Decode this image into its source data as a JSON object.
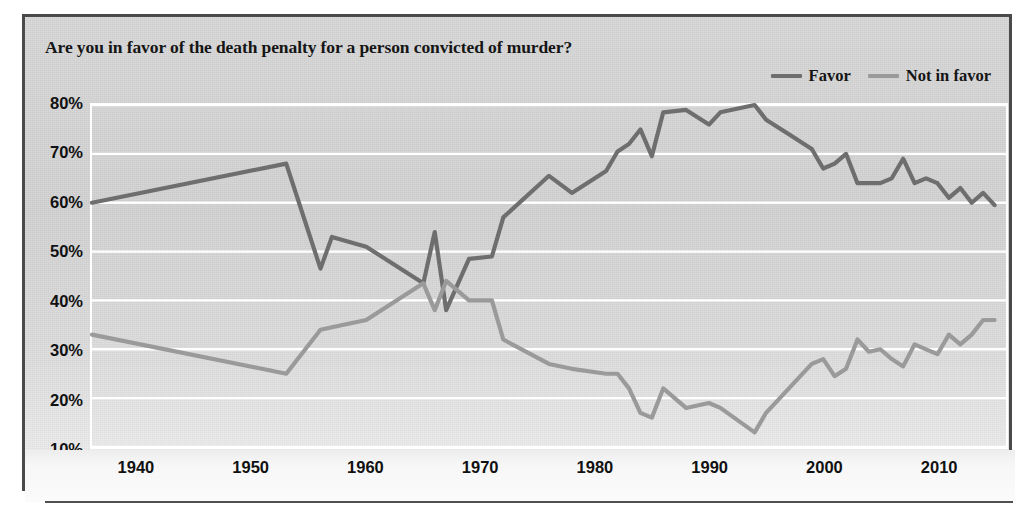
{
  "chart_data": {
    "type": "line",
    "title": "Are you in favor of the death penalty for a person convicted of murder?",
    "xlabel": "",
    "ylabel": "",
    "xlim": [
      1936,
      2016
    ],
    "ylim": [
      10,
      80
    ],
    "grid": true,
    "grid_color": "#ffffff",
    "legend_position": "top-right",
    "ytick_labels": [
      "80%",
      "70%",
      "60%",
      "50%",
      "40%",
      "30%",
      "20%",
      "10%"
    ],
    "ytick_values": [
      80,
      70,
      60,
      50,
      40,
      30,
      20,
      10
    ],
    "xtick_labels": [
      "1940",
      "1950",
      "1960",
      "1970",
      "1980",
      "1990",
      "2000",
      "2010"
    ],
    "xtick_values": [
      1940,
      1950,
      1960,
      1970,
      1980,
      1990,
      2000,
      2010
    ],
    "series": [
      {
        "name": "Favor",
        "color": "#6e6e6e",
        "x": [
          1936,
          1953,
          1956,
          1957,
          1960,
          1965,
          1966,
          1967,
          1969,
          1971,
          1972,
          1976,
          1978,
          1981,
          1982,
          1983,
          1984,
          1985,
          1986,
          1988,
          1990,
          1991,
          1994,
          1995,
          1997,
          1999,
          2000,
          2001,
          2002,
          2003,
          2004,
          2005,
          2006,
          2007,
          2008,
          2009,
          2010,
          2011,
          2012,
          2013,
          2014,
          2015
        ],
        "values": [
          60,
          68,
          46.5,
          53,
          51,
          43.5,
          54,
          38,
          48.5,
          49,
          57,
          65.5,
          62,
          66.5,
          70.5,
          72,
          75,
          69.5,
          78.5,
          79,
          76,
          78.5,
          80,
          77,
          74,
          71,
          67,
          68,
          70,
          64,
          64,
          64,
          65,
          69,
          64,
          65,
          64,
          61,
          63,
          60,
          62,
          59.5
        ]
      },
      {
        "name": "Not in favor",
        "color": "#9a9a9a",
        "x": [
          1936,
          1953,
          1956,
          1957,
          1960,
          1965,
          1966,
          1967,
          1969,
          1971,
          1972,
          1976,
          1978,
          1981,
          1982,
          1983,
          1984,
          1985,
          1986,
          1988,
          1990,
          1991,
          1994,
          1995,
          1997,
          1999,
          2000,
          2001,
          2002,
          2003,
          2004,
          2005,
          2006,
          2007,
          2008,
          2009,
          2010,
          2011,
          2012,
          2013,
          2014,
          2015
        ],
        "values": [
          33,
          25,
          34,
          34.5,
          36,
          43.5,
          38,
          44,
          40,
          40,
          32,
          27,
          26,
          25,
          25,
          22,
          17,
          16,
          22,
          18,
          19,
          18,
          13,
          17,
          22,
          27,
          28,
          24.5,
          26,
          32,
          29.5,
          30,
          28,
          26.5,
          31,
          30,
          29,
          33,
          31,
          33,
          36,
          36
        ]
      }
    ]
  },
  "legend": [
    {
      "label": "Favor",
      "color": "#6e6e6e"
    },
    {
      "label": "Not in favor",
      "color": "#9a9a9a"
    }
  ]
}
